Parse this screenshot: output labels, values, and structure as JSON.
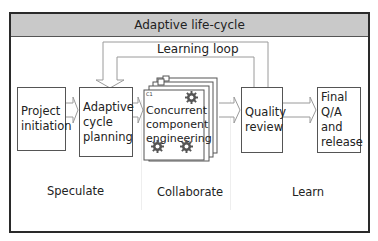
{
  "diagram": {
    "title": "Adaptive life-cycle",
    "loop_label": "Learning loop",
    "boxes": [
      {
        "id": "project-initiation",
        "lines": [
          "Project",
          "initiation"
        ]
      },
      {
        "id": "adaptive-cycle-planning",
        "lines": [
          "Adaptive",
          "cycle",
          "planning"
        ]
      },
      {
        "id": "concurrent-component-engineering",
        "lines": [
          "Concurrent",
          "component",
          "engineering"
        ],
        "stack_labels": [
          "C1",
          "C2",
          "C3"
        ]
      },
      {
        "id": "quality-review",
        "lines": [
          "Quality",
          "review"
        ]
      },
      {
        "id": "final-qa-release",
        "lines": [
          "Final",
          "Q/A and",
          "release"
        ]
      }
    ],
    "phases": [
      "Speculate",
      "Collaborate",
      "Learn"
    ],
    "icons": [
      "gear-icon",
      "gear-icon",
      "gear-icon"
    ],
    "colors": {
      "header_bg": "#c9c9c9",
      "border": "#2a2a2a",
      "arrow": "#9a9a9a"
    }
  }
}
